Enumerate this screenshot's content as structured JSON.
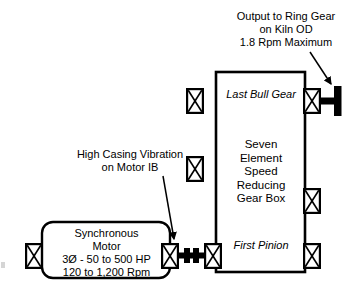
{
  "diagram": {
    "background_color": "#ffffff",
    "stroke_color": "#000000"
  },
  "annotations": {
    "output": {
      "text": "Output to Ring Gear\non Kiln OD\n1.8 Rpm Maximum",
      "lines": [
        "Output to Ring Gear",
        "on Kiln OD",
        "1.8 Rpm Maximum"
      ]
    },
    "vibration": {
      "text": "High Casing Vibration\non Motor IB",
      "lines": [
        "High Casing Vibration",
        "on Motor IB"
      ]
    }
  },
  "gearbox": {
    "last_bull_gear_label": "Last Bull Gear",
    "description": "Seven\nElement\nSpeed\nReducing\nGear Box",
    "description_lines": [
      "Seven",
      "Element",
      "Speed",
      "Reducing",
      "Gear Box"
    ],
    "first_pinion_label": "First Pinion",
    "bearings": [
      {
        "name": "bearing-gearbox-left-upper",
        "position": "left-upper"
      },
      {
        "name": "bearing-gearbox-left-lower",
        "position": "left-lower"
      },
      {
        "name": "bearing-gearbox-right-upper",
        "position": "right-upper"
      },
      {
        "name": "bearing-gearbox-right-mid",
        "position": "right-mid"
      },
      {
        "name": "bearing-gearbox-right-lower",
        "position": "right-lower"
      }
    ]
  },
  "motor": {
    "text": "Synchronous\nMotor\n3Ø - 50 to 500 HP\n120 to 1,200 Rpm",
    "lines": [
      "Synchronous",
      "Motor",
      "3Ø - 50 to 500 HP",
      "120 to 1,200 Rpm"
    ],
    "bearings": [
      {
        "name": "bearing-motor-outboard",
        "position": "left"
      },
      {
        "name": "bearing-motor-inboard",
        "position": "right"
      }
    ]
  },
  "coupling": {
    "name": "motor-gearbox-coupling"
  },
  "output_shaft": {
    "name": "output-shaft-flange"
  }
}
